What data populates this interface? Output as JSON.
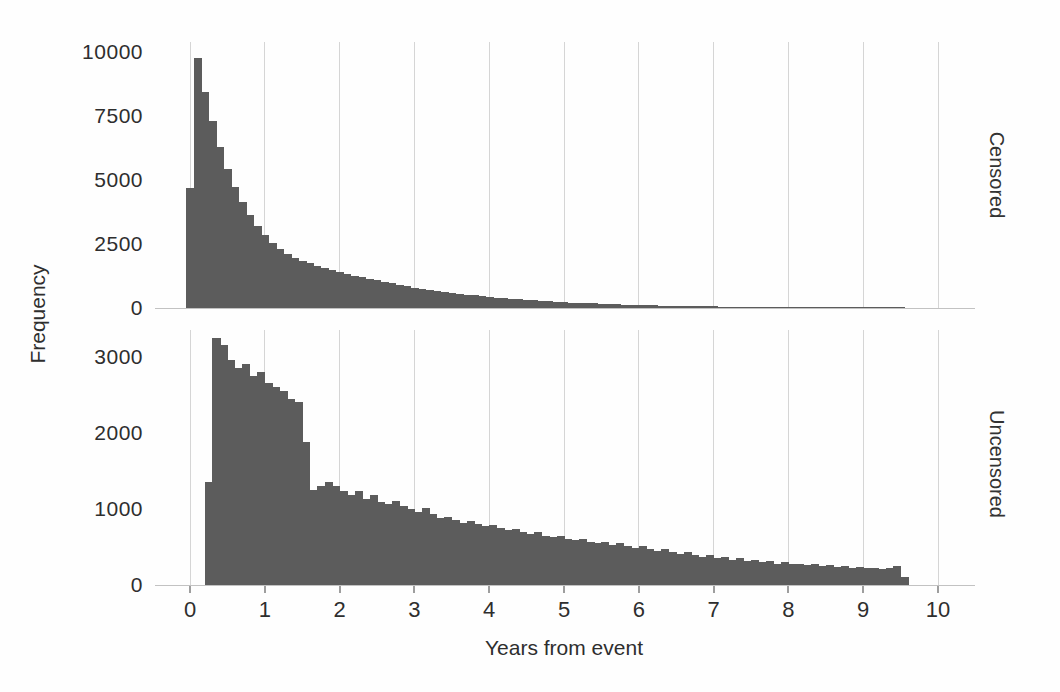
{
  "figure": {
    "background": "#fefefe"
  },
  "chart_data": {
    "type": "bar",
    "subtype": "faceted-histogram",
    "title": "",
    "xlabel": "Years from event",
    "ylabel": "Frequency",
    "x_ticks": [
      0,
      1,
      2,
      3,
      4,
      5,
      6,
      7,
      8,
      9,
      10
    ],
    "xlim": [
      -0.47,
      10.47
    ],
    "bin_width": 0.1,
    "grid": "vertical-gridlines-only",
    "legend": "none",
    "bar_color": "#5c5c5c",
    "grid_color": "#d5d5d5",
    "axis_text_color": "#2e2e2e",
    "facets": [
      {
        "label": "Censored",
        "strip_position": "right",
        "y_ticks": [
          0,
          2500,
          5000,
          7500,
          10000
        ],
        "ylim": [
          0,
          10400
        ],
        "bin_start": -0.05,
        "counts": [
          4700,
          9760,
          8450,
          7300,
          6300,
          5450,
          4750,
          4150,
          3650,
          3200,
          2850,
          2550,
          2300,
          2100,
          1950,
          1850,
          1750,
          1660,
          1570,
          1490,
          1410,
          1340,
          1270,
          1200,
          1140,
          1080,
          1020,
          960,
          900,
          850,
          800,
          755,
          710,
          670,
          630,
          595,
          560,
          525,
          495,
          465,
          435,
          410,
          385,
          360,
          340,
          318,
          298,
          280,
          262,
          246,
          230,
          215,
          202,
          189,
          177,
          166,
          155,
          145,
          136,
          127,
          119,
          111,
          104,
          97,
          91,
          85,
          80,
          75,
          70,
          65,
          61,
          57,
          53,
          50,
          47,
          44,
          41,
          38,
          36,
          33,
          31,
          29,
          27,
          25,
          24,
          22,
          21,
          19,
          18,
          17,
          16,
          15,
          14,
          13,
          12,
          11
        ]
      },
      {
        "label": "Uncensored",
        "strip_position": "right",
        "y_ticks": [
          0,
          1000,
          2000,
          3000
        ],
        "ylim": [
          0,
          3350
        ],
        "bin_start": 0.2,
        "counts": [
          1350,
          3250,
          3150,
          2950,
          2850,
          2900,
          2750,
          2800,
          2650,
          2600,
          2550,
          2450,
          2400,
          1880,
          1250,
          1300,
          1350,
          1300,
          1230,
          1180,
          1230,
          1130,
          1180,
          1090,
          1060,
          1110,
          1040,
          1000,
          960,
          1010,
          930,
          880,
          900,
          850,
          820,
          840,
          800,
          770,
          790,
          750,
          720,
          740,
          700,
          670,
          690,
          650,
          630,
          650,
          610,
          590,
          610,
          570,
          550,
          570,
          530,
          550,
          510,
          490,
          510,
          470,
          450,
          470,
          430,
          410,
          430,
          390,
          370,
          390,
          350,
          370,
          330,
          350,
          310,
          330,
          300,
          310,
          280,
          300,
          270,
          280,
          260,
          270,
          250,
          260,
          240,
          250,
          230,
          240,
          220,
          230,
          210,
          220,
          250,
          110
        ]
      }
    ]
  }
}
